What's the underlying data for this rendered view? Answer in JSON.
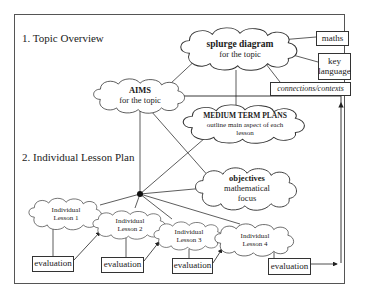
{
  "headings": {
    "section1": "1. Topic Overview",
    "section2": "2. Individual Lesson Plan"
  },
  "nodes": {
    "splurge": {
      "title": "splurge diagram",
      "subtitle": "for the topic"
    },
    "aims": {
      "title": "AIMS",
      "subtitle": "for the topic"
    },
    "medium_term": {
      "title": "MEDIUM TERM PLANS",
      "line1": "outline main aspect of each",
      "line2": "lesson"
    },
    "objectives": {
      "title": "objectives",
      "line1": "mathematical",
      "line2": "focus"
    },
    "maths": "maths",
    "key_language": {
      "line1": "key",
      "line2": "language"
    },
    "connections": "connections/contexts",
    "lessons": [
      {
        "line1": "Individual",
        "line2": "Lesson 1"
      },
      {
        "line1": "Individual",
        "line2": "Lesson 2"
      },
      {
        "line1": "Individual",
        "line2": "Lesson 3"
      },
      {
        "line1": "Individual",
        "line2": "Lesson 4"
      }
    ],
    "evaluations": [
      "evaluation",
      "evaluation",
      "evaluation",
      "evaluation"
    ]
  },
  "colors": {
    "line": "#333333",
    "background": "#ffffff"
  }
}
